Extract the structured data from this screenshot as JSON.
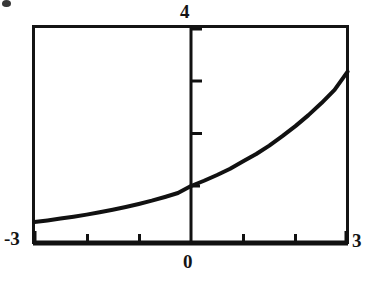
{
  "figure": {
    "title": "",
    "background_color": "#ffffff",
    "ink_color": "#111111"
  },
  "labels": {
    "y_max": "4",
    "x_min": "-3",
    "x_max": "3",
    "origin": "0"
  },
  "artifacts": {
    "top_left_speck": "scan-speck"
  },
  "chart_data": {
    "type": "line",
    "title": "",
    "xlabel": "",
    "ylabel": "",
    "xlim": [
      -3,
      3
    ],
    "ylim": [
      0,
      4
    ],
    "grid": false,
    "legend": null,
    "axis_style": "boxed-frame-with-interior-axes",
    "x_tick_labels": [
      "-3",
      "0",
      "3"
    ],
    "y_tick_labels": [
      "4"
    ],
    "x_ticks": [
      -3,
      -2,
      -1,
      0,
      1,
      2,
      3
    ],
    "y_ticks": [
      1,
      2,
      3,
      4
    ],
    "y_axis_x_position": 0,
    "x_axis_y_position": 0,
    "series": [
      {
        "name": "exponential curve",
        "function": "y = 1.47^x",
        "line_width_px": 4,
        "color": "#111111",
        "x": [
          -3,
          -2.75,
          -2.5,
          -2.25,
          -2,
          -1.75,
          -1.5,
          -1.25,
          -1,
          -0.75,
          -0.5,
          -0.25,
          0,
          0.25,
          0.5,
          0.75,
          1,
          1.25,
          1.5,
          1.75,
          2,
          2.25,
          2.5,
          2.75,
          3
        ],
        "values": [
          0.315,
          0.345,
          0.379,
          0.415,
          0.455,
          0.499,
          0.547,
          0.6,
          0.658,
          0.721,
          0.791,
          0.867,
          1.0,
          1.1,
          1.21,
          1.33,
          1.47,
          1.61,
          1.77,
          1.95,
          2.14,
          2.35,
          2.58,
          2.83,
          3.18
        ]
      }
    ],
    "annotations": [
      {
        "text": "4",
        "position": "above y-axis top"
      },
      {
        "text": "-3",
        "position": "left of x-axis start"
      },
      {
        "text": "3",
        "position": "right of x-axis end"
      },
      {
        "text": "0",
        "position": "below origin"
      }
    ]
  }
}
